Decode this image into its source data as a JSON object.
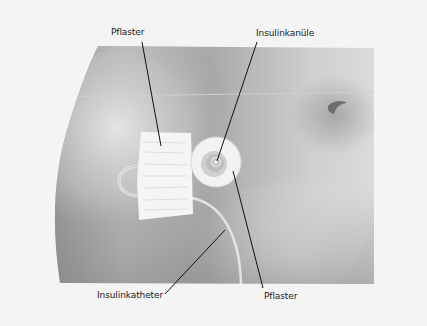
{
  "diagram": {
    "type": "anatomical illustration",
    "labels": [
      {
        "id": "pflaster-top",
        "text": "Pflaster"
      },
      {
        "id": "insulinkanuele",
        "text": "Insulinkanüle"
      },
      {
        "id": "insulinkatheter",
        "text": "Insulinkatheter"
      },
      {
        "id": "pflaster-bottom",
        "text": "Pflaster"
      }
    ]
  },
  "colors": {
    "background": "#f4f4f4",
    "skin_dark": "#8e8e8e",
    "skin_light": "#d8d8d8",
    "patch": "#f6f6f6",
    "leader_line": "#111111",
    "label_text": "#1a1a1a"
  }
}
